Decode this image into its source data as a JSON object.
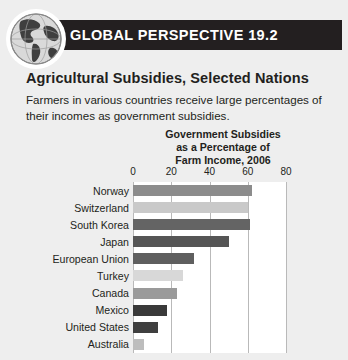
{
  "box": {
    "banner_title": "GLOBAL PERSPECTIVE 19.2",
    "globe_icon": "globe-icon",
    "figure_title": "Agricultural Subsidies, Selected Nations",
    "figure_description": "Farmers in various countries receive large percentages of their incomes as government subsidies."
  },
  "chart_data": {
    "type": "bar",
    "orientation": "horizontal",
    "title_lines": [
      "Government Subsidies",
      "as a Percentage of",
      "Farm Income, 2006"
    ],
    "xlabel": "",
    "ylabel": "",
    "xlim": [
      0,
      80
    ],
    "ticks": [
      0,
      20,
      40,
      60,
      80
    ],
    "tick_labels": [
      "0",
      "20",
      "40",
      "60",
      "80"
    ],
    "grid": true,
    "legend": "none",
    "categories": [
      "Norway",
      "Switzerland",
      "South Korea",
      "Japan",
      "European Union",
      "Turkey",
      "Canada",
      "Mexico",
      "United States",
      "Australia"
    ],
    "values": [
      62,
      60,
      61,
      50,
      32,
      26,
      23,
      18,
      13,
      6
    ],
    "bar_colors": [
      "#8c8c8c",
      "#c9c9c9",
      "#646464",
      "#555555",
      "#5f5f5f",
      "#d8d8d8",
      "#9a9a9a",
      "#3a3a3a",
      "#3f3f3f",
      "#bdbdbd"
    ]
  },
  "colors": {
    "panel_background": "#eeeeee",
    "banner_background": "#231f20",
    "banner_text": "#ffffff",
    "plot_background": "#ffffff",
    "gridline": "#b9b9b9",
    "text": "#231f20"
  }
}
